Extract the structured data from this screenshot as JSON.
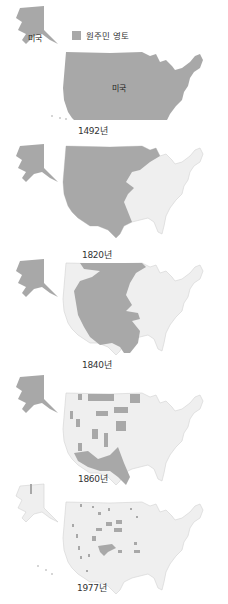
{
  "legend": {
    "label": "원주민 영토",
    "swatch_color": "#a8a8a8"
  },
  "colors": {
    "native": "#a8a8a8",
    "us": "#efefef",
    "border": "#d2d2d2"
  },
  "labels": {
    "alaska": "미국",
    "mainland": "미국"
  },
  "panels": [
    {
      "year": "1492년",
      "native_share": "all"
    },
    {
      "year": "1820년",
      "native_share": "west of Mississippi"
    },
    {
      "year": "1840년",
      "native_share": "central plains and west interior"
    },
    {
      "year": "1860년",
      "native_share": "southwest and scattered reservations"
    },
    {
      "year": "1977년",
      "native_share": "small scattered reservations"
    }
  ]
}
